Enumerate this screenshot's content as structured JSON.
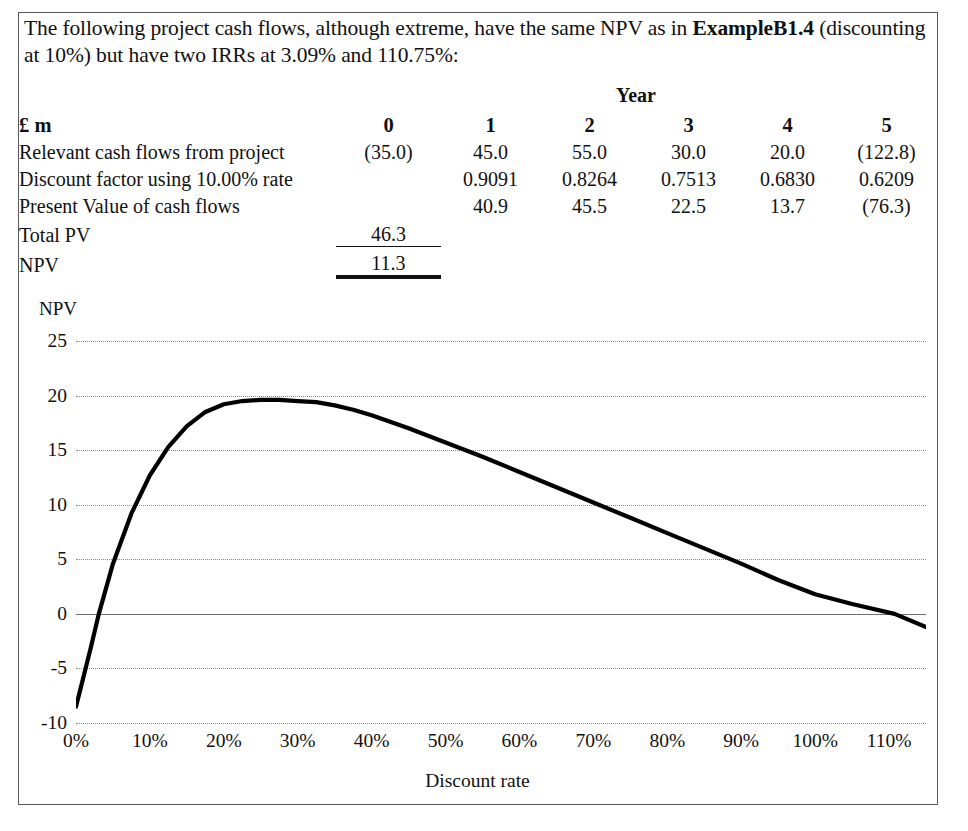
{
  "intro": {
    "line1_a": "The following project cash flows, although extreme, have the same NPV as in ",
    "line1_b": "Example",
    "line2_a": "B1.4",
    "line2_b": " (discounting at 10%) but have two IRRs at 3.09% and 110.75%:"
  },
  "table": {
    "year_band": "Year",
    "unit_header": "£ m",
    "columns": [
      "0",
      "1",
      "2",
      "3",
      "4",
      "5"
    ],
    "rows": [
      {
        "label": "Relevant cash flows from project",
        "values": [
          "(35.0)",
          "45.0",
          "55.0",
          "30.0",
          "20.0",
          "(122.8)"
        ]
      },
      {
        "label": "Discount factor using 10.00% rate",
        "values": [
          "",
          "0.9091",
          "0.8264",
          "0.7513",
          "0.6830",
          "0.6209"
        ]
      },
      {
        "label": "Present Value of cash flows",
        "values": [
          "",
          "40.9",
          "45.5",
          "22.5",
          "13.7",
          "(76.3)"
        ]
      }
    ],
    "summary": [
      {
        "label": "Total PV",
        "value": "46.3"
      },
      {
        "label": "NPV",
        "value": "11.3"
      }
    ]
  },
  "chart_data": {
    "type": "line",
    "title": "",
    "ylabel": "NPV",
    "xlabel": "Discount rate",
    "ylim": [
      -10,
      25
    ],
    "xlim": [
      0,
      115
    ],
    "grid": true,
    "legend": "none",
    "ytick_labels": [
      "25",
      "20",
      "15",
      "10",
      "5",
      "0",
      "-5",
      "-10"
    ],
    "ytick_values": [
      25,
      20,
      15,
      10,
      5,
      0,
      -5,
      -10
    ],
    "xtick_labels": [
      "0%",
      "10%",
      "20%",
      "30%",
      "40%",
      "50%",
      "60%",
      "70%",
      "80%",
      "90%",
      "100%",
      "110%"
    ],
    "xtick_values": [
      0,
      10,
      20,
      30,
      40,
      50,
      60,
      70,
      80,
      90,
      100,
      110
    ],
    "series": [
      {
        "name": "NPV vs discount rate",
        "x": [
          0,
          2,
          3.09,
          5,
          7.5,
          10,
          12.5,
          15,
          17.5,
          20,
          22.5,
          25,
          27.5,
          30,
          32.5,
          35,
          37.5,
          40,
          45,
          50,
          55,
          60,
          65,
          70,
          75,
          80,
          85,
          90,
          95,
          100,
          105,
          110.75,
          115
        ],
        "y": [
          -8.5,
          -3.1,
          0.0,
          4.6,
          9.2,
          12.7,
          15.3,
          17.2,
          18.5,
          19.2,
          19.5,
          19.6,
          19.6,
          19.5,
          19.4,
          19.1,
          18.7,
          18.2,
          17.0,
          15.7,
          14.4,
          13.0,
          11.6,
          10.2,
          8.8,
          7.4,
          6.0,
          4.6,
          3.1,
          1.8,
          0.9,
          0.0,
          -1.2
        ]
      }
    ],
    "annotations": {
      "irr_1": "3.09%",
      "irr_2": "110.75%"
    }
  }
}
